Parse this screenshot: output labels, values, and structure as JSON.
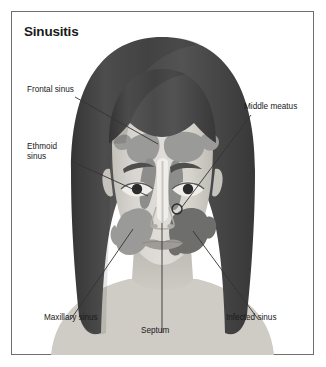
{
  "figure": {
    "title": "Sinusitis",
    "border_color": "#6f6f6f",
    "background": "#ffffff"
  },
  "illustration": {
    "subject": "front-facing female head with sinus overlay",
    "palette": {
      "hair": "#4a4a4a",
      "hair_shadow": "#3a3a3a",
      "skin": "#d8d4cf",
      "skin_shadow": "#c2beb8",
      "sinus_normal": "#9a9a99",
      "sinus_infected": "#6e6e6d",
      "nasal_cavity": "#f0eeea",
      "leader_line": "#333333",
      "label_text": "#1a1a1a"
    }
  },
  "labels": [
    {
      "id": "frontal",
      "text": "Frontal sinus",
      "lines": [
        "Frontal sinus"
      ]
    },
    {
      "id": "ethmoid",
      "text": "Ethmoid sinus",
      "lines": [
        "Ethmoid",
        "sinus"
      ]
    },
    {
      "id": "middle",
      "text": "Middle meatus",
      "lines": [
        "Middle meatus"
      ]
    },
    {
      "id": "maxillary",
      "text": "Maxillary sinus",
      "lines": [
        "Maxillary sinus"
      ]
    },
    {
      "id": "septum",
      "text": "Septum",
      "lines": [
        "Septum"
      ]
    },
    {
      "id": "infected",
      "text": "Infected sinus",
      "lines": [
        "Infected sinus"
      ]
    }
  ],
  "label_text": {
    "frontal": "Frontal sinus",
    "ethmoid_1": "Ethmoid",
    "ethmoid_2": "sinus",
    "middle": "Middle meatus",
    "maxillary": "Maxillary sinus",
    "septum": "Septum",
    "infected": "Infected sinus"
  }
}
